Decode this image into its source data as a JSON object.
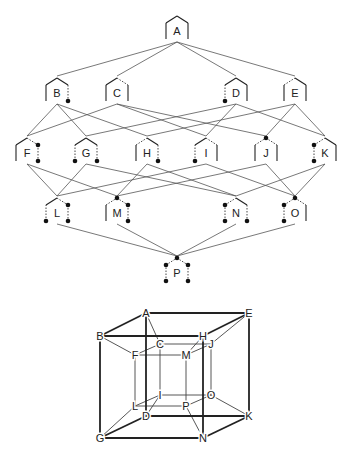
{
  "lattice": {
    "nodes": [
      {
        "id": "A",
        "x": 177,
        "y": 28,
        "sides": [
          "solid",
          "solid",
          "solid",
          "solid"
        ],
        "dots": []
      },
      {
        "id": "B",
        "x": 57,
        "y": 90,
        "sides": [
          "solid",
          "solid",
          "solid",
          "dash"
        ],
        "dots": [
          "br"
        ]
      },
      {
        "id": "C",
        "x": 117,
        "y": 90,
        "sides": [
          "solid",
          "solid",
          "dash",
          "solid"
        ],
        "dots": []
      },
      {
        "id": "D",
        "x": 236,
        "y": 90,
        "sides": [
          "dash",
          "solid",
          "solid",
          "solid"
        ],
        "dots": [
          "bl"
        ]
      },
      {
        "id": "E",
        "x": 295,
        "y": 90,
        "sides": [
          "solid",
          "dash",
          "solid",
          "solid"
        ],
        "dots": []
      },
      {
        "id": "F",
        "x": 27,
        "y": 150,
        "sides": [
          "solid",
          "solid",
          "dash",
          "dash"
        ],
        "dots": [
          "tr",
          "br"
        ]
      },
      {
        "id": "G",
        "x": 86,
        "y": 150,
        "sides": [
          "dash",
          "solid",
          "solid",
          "dash"
        ],
        "dots": [
          "bl",
          "br"
        ]
      },
      {
        "id": "H",
        "x": 147,
        "y": 150,
        "sides": [
          "solid",
          "dash",
          "solid",
          "dash"
        ],
        "dots": [
          "br"
        ]
      },
      {
        "id": "I",
        "x": 206,
        "y": 150,
        "sides": [
          "dash",
          "solid",
          "dash",
          "solid"
        ],
        "dots": [
          "bl"
        ]
      },
      {
        "id": "J",
        "x": 266,
        "y": 150,
        "sides": [
          "solid",
          "dash",
          "dash",
          "solid"
        ],
        "dots": [
          "top"
        ]
      },
      {
        "id": "K",
        "x": 325,
        "y": 150,
        "sides": [
          "dash",
          "dash",
          "solid",
          "solid"
        ],
        "dots": [
          "tl",
          "bl"
        ]
      },
      {
        "id": "L",
        "x": 57,
        "y": 210,
        "sides": [
          "dash",
          "solid",
          "dash",
          "dash"
        ],
        "dots": [
          "bl",
          "tr",
          "br"
        ]
      },
      {
        "id": "M",
        "x": 117,
        "y": 210,
        "sides": [
          "solid",
          "dash",
          "dash",
          "dash"
        ],
        "dots": [
          "top",
          "tr",
          "br"
        ]
      },
      {
        "id": "N",
        "x": 236,
        "y": 210,
        "sides": [
          "dash",
          "dash",
          "solid",
          "dash"
        ],
        "dots": [
          "tl",
          "bl",
          "br"
        ]
      },
      {
        "id": "O",
        "x": 295,
        "y": 210,
        "sides": [
          "dash",
          "dash",
          "dash",
          "solid"
        ],
        "dots": [
          "tl",
          "bl",
          "top"
        ]
      },
      {
        "id": "P",
        "x": 177,
        "y": 270,
        "sides": [
          "dash",
          "dash",
          "dash",
          "dash"
        ],
        "dots": [
          "tl",
          "bl",
          "top",
          "tr",
          "br"
        ]
      }
    ],
    "edges": [
      [
        "A",
        "B"
      ],
      [
        "A",
        "C"
      ],
      [
        "A",
        "D"
      ],
      [
        "A",
        "E"
      ],
      [
        "B",
        "F"
      ],
      [
        "B",
        "G"
      ],
      [
        "B",
        "H"
      ],
      [
        "C",
        "F"
      ],
      [
        "C",
        "I"
      ],
      [
        "C",
        "J"
      ],
      [
        "D",
        "G"
      ],
      [
        "D",
        "I"
      ],
      [
        "D",
        "K"
      ],
      [
        "E",
        "H"
      ],
      [
        "E",
        "J"
      ],
      [
        "E",
        "K"
      ],
      [
        "F",
        "L"
      ],
      [
        "F",
        "M"
      ],
      [
        "G",
        "L"
      ],
      [
        "G",
        "N"
      ],
      [
        "H",
        "M"
      ],
      [
        "H",
        "N"
      ],
      [
        "I",
        "L"
      ],
      [
        "I",
        "O"
      ],
      [
        "J",
        "M"
      ],
      [
        "J",
        "O"
      ],
      [
        "K",
        "N"
      ],
      [
        "K",
        "O"
      ],
      [
        "L",
        "P"
      ],
      [
        "M",
        "P"
      ],
      [
        "N",
        "P"
      ],
      [
        "O",
        "P"
      ]
    ]
  },
  "cube": {
    "nodes": [
      {
        "id": "A",
        "x": 146,
        "y": 313
      },
      {
        "id": "E",
        "x": 249,
        "y": 313
      },
      {
        "id": "B",
        "x": 100,
        "y": 336
      },
      {
        "id": "H",
        "x": 203,
        "y": 336
      },
      {
        "id": "C",
        "x": 160,
        "y": 344
      },
      {
        "id": "J",
        "x": 211,
        "y": 344
      },
      {
        "id": "F",
        "x": 135,
        "y": 355
      },
      {
        "id": "M",
        "x": 186,
        "y": 355
      },
      {
        "id": "I",
        "x": 160,
        "y": 395
      },
      {
        "id": "O",
        "x": 211,
        "y": 395
      },
      {
        "id": "L",
        "x": 135,
        "y": 406
      },
      {
        "id": "P",
        "x": 186,
        "y": 406
      },
      {
        "id": "D",
        "x": 146,
        "y": 416
      },
      {
        "id": "K",
        "x": 249,
        "y": 416
      },
      {
        "id": "G",
        "x": 100,
        "y": 438
      },
      {
        "id": "N",
        "x": 203,
        "y": 438
      }
    ],
    "thick_edges": [
      [
        "A",
        "E"
      ],
      [
        "A",
        "B"
      ],
      [
        "B",
        "H"
      ],
      [
        "H",
        "E"
      ],
      [
        "A",
        "D"
      ],
      [
        "B",
        "G"
      ],
      [
        "E",
        "K"
      ],
      [
        "H",
        "N"
      ],
      [
        "G",
        "N"
      ],
      [
        "N",
        "K"
      ],
      [
        "D",
        "K"
      ],
      [
        "G",
        "D"
      ]
    ],
    "thin_edges": [
      [
        "C",
        "J"
      ],
      [
        "C",
        "F"
      ],
      [
        "F",
        "M"
      ],
      [
        "M",
        "J"
      ],
      [
        "F",
        "L"
      ],
      [
        "C",
        "I"
      ],
      [
        "M",
        "P"
      ],
      [
        "J",
        "O"
      ],
      [
        "L",
        "P"
      ],
      [
        "I",
        "O"
      ],
      [
        "L",
        "I"
      ],
      [
        "P",
        "O"
      ],
      [
        "A",
        "C"
      ],
      [
        "B",
        "F"
      ],
      [
        "H",
        "M"
      ],
      [
        "E",
        "J"
      ],
      [
        "G",
        "L"
      ],
      [
        "D",
        "I"
      ],
      [
        "N",
        "P"
      ],
      [
        "K",
        "O"
      ]
    ]
  }
}
